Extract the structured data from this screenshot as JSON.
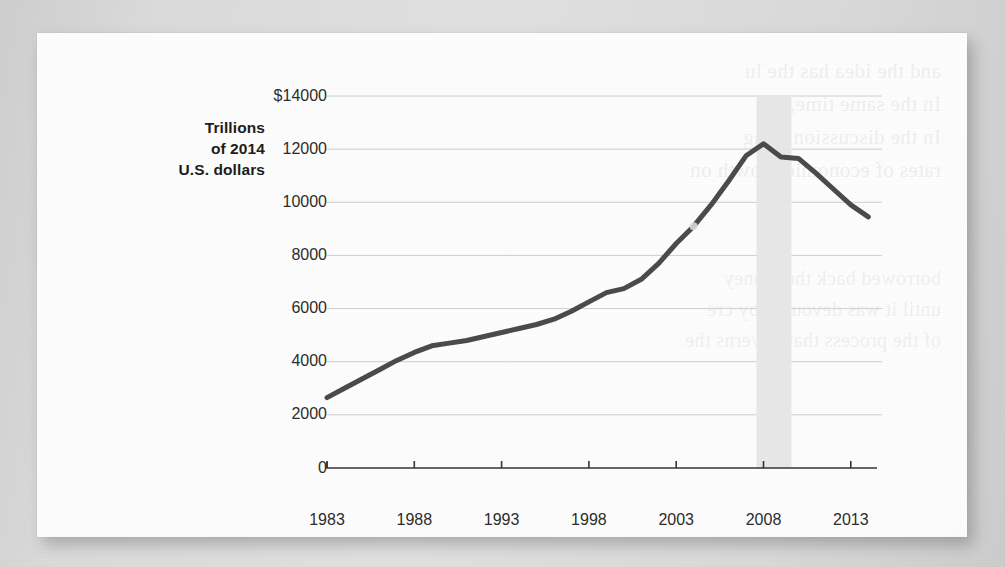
{
  "chart_data": {
    "type": "line",
    "title": "",
    "subtitle": "",
    "ylabel": "Trillions of 2014 U.S. dollars",
    "ylabel_lines": [
      "Trillions",
      "of 2014",
      "U.S. dollars"
    ],
    "xlabel": "",
    "xlim": [
      1983,
      2014.5
    ],
    "ylim": [
      0,
      14000
    ],
    "grid": true,
    "legend": null,
    "ytick_labels": [
      "$14000",
      "12000",
      "10000",
      "8000",
      "6000",
      "4000",
      "2000",
      "0"
    ],
    "ytick_values": [
      14000,
      12000,
      10000,
      8000,
      6000,
      4000,
      2000,
      0
    ],
    "xtick_labels": [
      "1983",
      "1988",
      "1993",
      "1998",
      "2003",
      "2008",
      "2013"
    ],
    "xtick_values": [
      1983,
      1988,
      1993,
      1998,
      2003,
      2008,
      2013
    ],
    "x": [
      1983,
      1984,
      1985,
      1986,
      1987,
      1988,
      1989,
      1990,
      1991,
      1992,
      1993,
      1994,
      1995,
      1996,
      1997,
      1998,
      1999,
      2000,
      2001,
      2002,
      2003,
      2004,
      2005,
      2006,
      2007,
      2008,
      2009,
      2010,
      2011,
      2012,
      2013,
      2014
    ],
    "values": [
      2650,
      3000,
      3350,
      3700,
      4050,
      4350,
      4600,
      4700,
      4800,
      4950,
      5100,
      5250,
      5400,
      5600,
      5900,
      6250,
      6600,
      6750,
      7100,
      7700,
      8450,
      9100,
      9900,
      10800,
      11750,
      12200,
      11700,
      11650,
      11100,
      10500,
      9900,
      9450
    ],
    "line_color": "#4a4a4a",
    "line_width": 5,
    "shaded_band": {
      "label": "recession",
      "x_start": 2007.6,
      "x_end": 2009.6,
      "color": "#e8e8e8"
    }
  },
  "background": {
    "page_color": "#d9d9d9",
    "card_color": "#fdfdfd",
    "showthrough_top": "and the idea has the lu\nIn the same time, the\nIn the discussion of ag\nrates of economic growth on",
    "showthrough_bottom": "borrowed back the money\nuntil it was devoured by cre\nof the process that governs the"
  }
}
